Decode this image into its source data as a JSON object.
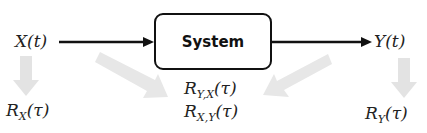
{
  "diagram": {
    "input": {
      "label": "X(t)"
    },
    "system": {
      "label": "System"
    },
    "output": {
      "label": "Y(t)"
    },
    "input_autocorr": {
      "base": "R",
      "sub": "X",
      "arg": "(τ)"
    },
    "output_autocorr": {
      "base": "R",
      "sub": "Y",
      "arg": "(τ)"
    },
    "cross_corr_yx": {
      "base": "R",
      "sub": "Y,X",
      "arg": "(τ)"
    },
    "cross_corr_xy": {
      "base": "R",
      "sub": "X,Y",
      "arg": "(τ)"
    },
    "colors": {
      "main_arrow": "#111111",
      "gray_arrow": "#e3e3e3",
      "text": "#222222"
    }
  }
}
